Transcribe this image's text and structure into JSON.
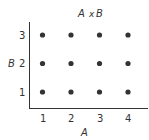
{
  "chart_data": {
    "type": "scatter",
    "title": "A x B",
    "xlabel": "A",
    "ylabel": "B",
    "x_ticks": [
      "1",
      "2",
      "3",
      "4"
    ],
    "y_ticks": [
      "1",
      "2",
      "3"
    ],
    "xlim": [
      0.5,
      4.5
    ],
    "ylim": [
      0.5,
      3.5
    ],
    "grid": false,
    "points": [
      {
        "x": 1,
        "y": 1
      },
      {
        "x": 2,
        "y": 1
      },
      {
        "x": 3,
        "y": 1
      },
      {
        "x": 4,
        "y": 1
      },
      {
        "x": 1,
        "y": 2
      },
      {
        "x": 2,
        "y": 2
      },
      {
        "x": 3,
        "y": 2
      },
      {
        "x": 4,
        "y": 2
      },
      {
        "x": 1,
        "y": 3
      },
      {
        "x": 2,
        "y": 3
      },
      {
        "x": 3,
        "y": 3
      },
      {
        "x": 4,
        "y": 3
      }
    ],
    "point_color": "#333333"
  },
  "labels": {
    "title_a": "A",
    "title_x": "x",
    "title_b": "B",
    "x_axis": "A",
    "y_axis": "B",
    "x1": "1",
    "x2": "2",
    "x3": "3",
    "x4": "4",
    "y1": "1",
    "y2": "2",
    "y3": "3"
  }
}
